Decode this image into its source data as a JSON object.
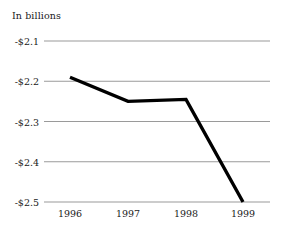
{
  "chart_data": {
    "type": "line",
    "title": "In billions",
    "xlabel": "",
    "ylabel": "",
    "categories": [
      "1996",
      "1997",
      "1998",
      "1999"
    ],
    "x": [
      1996,
      1997,
      1998,
      1999
    ],
    "values": [
      -2.19,
      -2.25,
      -2.245,
      -2.5
    ],
    "series": [
      {
        "name": "In billions",
        "values": [
          -2.19,
          -2.25,
          -2.245,
          -2.5
        ]
      }
    ],
    "ylim": [
      -2.5,
      -2.1
    ],
    "yticks": [
      -2.1,
      -2.2,
      -2.3,
      -2.4,
      -2.5
    ],
    "ytick_labels": [
      "-$2.1",
      "-$2.2",
      "-$2.3",
      "-$2.4",
      "-$2.5"
    ],
    "xtick_labels": [
      "1996",
      "1997",
      "1998",
      "1999"
    ],
    "grid": true,
    "grid_axis": "y",
    "legend": false,
    "legend_position": "none",
    "line_color": "#000000",
    "grid_color": "#9a9a9a",
    "background_color": "#ffffff",
    "text_color": "#1a1a1a"
  },
  "axes": {
    "y": {
      "ticks": [
        {
          "label": "-$2.1",
          "value": -2.1
        },
        {
          "label": "-$2.2",
          "value": -2.2
        },
        {
          "label": "-$2.3",
          "value": -2.3
        },
        {
          "label": "-$2.4",
          "value": -2.4
        },
        {
          "label": "-$2.5",
          "value": -2.5
        }
      ]
    },
    "x": {
      "ticks": [
        {
          "label": "1996",
          "value": 1996
        },
        {
          "label": "1997",
          "value": 1997
        },
        {
          "label": "1998",
          "value": 1998
        },
        {
          "label": "1999",
          "value": 1999
        }
      ]
    }
  }
}
